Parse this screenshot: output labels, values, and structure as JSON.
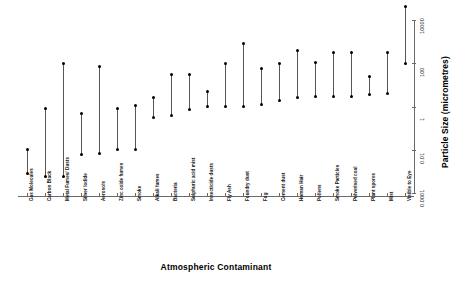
{
  "chart_data": {
    "type": "scatter",
    "title": "",
    "subtitle": "",
    "xlabel": "Atmospheric Contaminant",
    "ylabel": "Particle Size (micrometres)",
    "yscale": "log",
    "ylim": [
      0.0001,
      10000
    ],
    "y_ticks": [
      "10000",
      "100",
      "1",
      "0.01",
      "0.0001"
    ],
    "y_tick_values": [
      10000,
      100,
      1,
      0.01,
      0.0001
    ],
    "grid": false,
    "legend": "none",
    "axis_position": "y-axis on right, x-axis at bottom",
    "annotation": "Each category is drawn as a vertical line spanning its particle size range, with a filled dot marking the minimum and maximum value.",
    "categories": [
      "Gas Molecules",
      "Carbon Black",
      "Metal Fumes/ Dusts",
      "Silver Iodide",
      "Aerosols",
      "Zinc oxide fumes",
      "Smoke",
      "Alkali fumes",
      "Bacteria",
      "Sulphuric acid mist",
      "Insecticide dusts",
      "Fly Ash",
      "Foundry dust",
      "Fog",
      "Cement dust",
      "Human Hair",
      "Pollens",
      "Smoke Particles",
      "Pulverised coal",
      "Plant spores",
      "Mist",
      "Visible to Eye"
    ],
    "series": [
      {
        "name": "min",
        "values": [
          0.0008,
          0.0006,
          0.0006,
          0.006,
          0.007,
          0.01,
          0.01,
          0.3,
          0.4,
          0.7,
          1.0,
          1.0,
          1.0,
          1.2,
          1.8,
          2.5,
          3.0,
          3.0,
          3.0,
          3.5,
          4.0,
          100
        ]
      },
      {
        "name": "max",
        "values": [
          0.01,
          0.8,
          100,
          0.5,
          70,
          0.8,
          1.1,
          2.5,
          30,
          30,
          5.0,
          100,
          800,
          60,
          100,
          400,
          110,
          300,
          300,
          25,
          300,
          40000
        ]
      }
    ],
    "points": [
      {
        "category": "Gas Molecules",
        "min": 0.0008,
        "max": 0.01
      },
      {
        "category": "Carbon Black",
        "min": 0.0006,
        "max": 0.8
      },
      {
        "category": "Metal Fumes/ Dusts",
        "min": 0.0006,
        "max": 100
      },
      {
        "category": "Silver Iodide",
        "min": 0.006,
        "max": 0.5
      },
      {
        "category": "Aerosols",
        "min": 0.007,
        "max": 70
      },
      {
        "category": "Zinc oxide fumes",
        "min": 0.01,
        "max": 0.8
      },
      {
        "category": "Smoke",
        "min": 0.01,
        "max": 1.1
      },
      {
        "category": "Alkali fumes",
        "min": 0.3,
        "max": 2.5
      },
      {
        "category": "Bacteria",
        "min": 0.4,
        "max": 30
      },
      {
        "category": "Sulphuric acid mist",
        "min": 0.7,
        "max": 30
      },
      {
        "category": "Insecticide dusts",
        "min": 1.0,
        "max": 5.0
      },
      {
        "category": "Fly Ash",
        "min": 1.0,
        "max": 100
      },
      {
        "category": "Foundry dust",
        "min": 1.0,
        "max": 800
      },
      {
        "category": "Fog",
        "min": 1.2,
        "max": 60
      },
      {
        "category": "Cement dust",
        "min": 1.8,
        "max": 100
      },
      {
        "category": "Human Hair",
        "min": 2.5,
        "max": 400
      },
      {
        "category": "Pollens",
        "min": 3.0,
        "max": 110
      },
      {
        "category": "Smoke Particles",
        "min": 3.0,
        "max": 300
      },
      {
        "category": "Pulverised coal",
        "min": 3.0,
        "max": 300
      },
      {
        "category": "Plant spores",
        "min": 3.5,
        "max": 25
      },
      {
        "category": "Mist",
        "min": 4.0,
        "max": 300
      },
      {
        "category": "Visible to Eye",
        "min": 100,
        "max": 40000
      }
    ]
  },
  "colors": {
    "marker": "#000000",
    "line": "#555555",
    "axis": "#6a6a6a",
    "text": "#111111",
    "background": "#ffffff"
  }
}
